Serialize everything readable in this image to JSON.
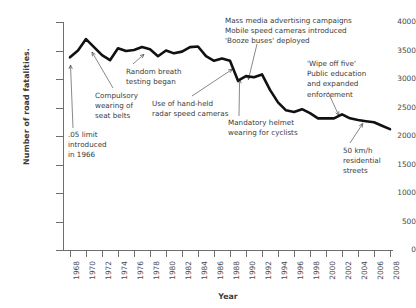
{
  "chart_data": {
    "type": "line",
    "title": "",
    "xlabel": "Year",
    "ylabel": "Number of road fatalities.",
    "xlim": [
      1968,
      2008
    ],
    "ylim": [
      0,
      4000
    ],
    "grid": false,
    "legend": "none",
    "line_color": "#111111",
    "x_ticks": [
      "1968",
      "1970",
      "1972",
      "1974",
      "1976",
      "1978",
      "1980",
      "1982",
      "1984",
      "1986",
      "1988",
      "1990",
      "1992",
      "1994",
      "1996",
      "1998",
      "2000",
      "2002",
      "2004",
      "2006",
      "2008"
    ],
    "y_ticks": [
      "0",
      "500",
      "1000",
      "1500",
      "2000",
      "2500",
      "3000",
      "3500",
      "4000"
    ],
    "x": [
      1968,
      1969,
      1970,
      1971,
      1972,
      1973,
      1974,
      1975,
      1976,
      1977,
      1978,
      1979,
      1980,
      1981,
      1982,
      1983,
      1984,
      1985,
      1986,
      1987,
      1988,
      1989,
      1990,
      1991,
      1992,
      1993,
      1994,
      1995,
      1996,
      1997,
      1998,
      1999,
      2000,
      2001,
      2002,
      2003,
      2004,
      2005,
      2006,
      2007,
      2008
    ],
    "values": [
      3380,
      3500,
      3700,
      3560,
      3420,
      3330,
      3540,
      3490,
      3510,
      3560,
      3520,
      3400,
      3500,
      3450,
      3480,
      3560,
      3570,
      3400,
      3320,
      3360,
      3320,
      2970,
      3050,
      3030,
      3080,
      2810,
      2590,
      2450,
      2420,
      2470,
      2400,
      2310,
      2310,
      2310,
      2380,
      2310,
      2280,
      2260,
      2240,
      2180,
      2120
    ],
    "annotations": [
      {
        "id": "blood-limit",
        "text": ".05 limit\nintroduced\nin 1966",
        "arrow_to_year": 1968,
        "arrow_to_value": 3350
      },
      {
        "id": "seatbelts",
        "text": "Compulsory\nwearing of\nseat belts",
        "arrow_to_year": 1971,
        "arrow_to_value": 3560
      },
      {
        "id": "breath-test",
        "text": "Random breath\ntesting began",
        "arrow_to_year": 1977,
        "arrow_to_value": 3520
      },
      {
        "id": "radar",
        "text": "Use of hand-held\nradar speed cameras",
        "arrow_to_year": 1988,
        "arrow_to_value": 3300
      },
      {
        "id": "helmet",
        "text": "Mandatory helmet\nwearing for cyclists",
        "arrow_to_year": 1990,
        "arrow_to_value": 3020
      },
      {
        "id": "massmedia",
        "text": "Mass media advertising campaigns\nMobile speed cameras introduced\n'Booze buses' deployed",
        "arrow_to_year": 1990,
        "arrow_to_value": 3030
      },
      {
        "id": "wipeoff",
        "text": "'Wipe off five'\nPublic education\nand expanded\nenforcement",
        "arrow_to_year": 2002,
        "arrow_to_value": 2380
      },
      {
        "id": "50kmh",
        "text": "50 km/h\nresidential\nstreets",
        "arrow_to_year": 2005,
        "arrow_to_value": 2255
      }
    ]
  }
}
